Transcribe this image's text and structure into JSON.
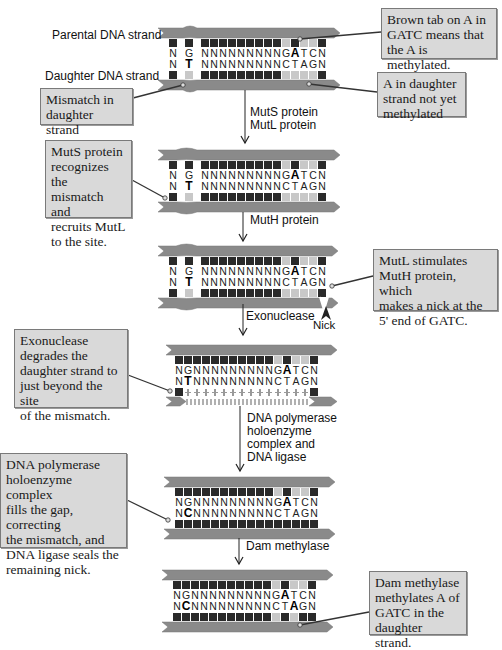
{
  "colors": {
    "backbone": "#8a8a8a",
    "backbone_light": "#a8a8a8",
    "base_dark": "#2a2a2a",
    "base_light": "#c8c8c8",
    "callout_bg": "#d9d9d9",
    "callout_border": "#7a7a7a"
  },
  "labels": {
    "parental": "Parental DNA strand",
    "daughter": "Daughter DNA strand",
    "nick": "Nick"
  },
  "steps": [
    {
      "line1": "MutS protein",
      "line2": "MutL protein"
    },
    {
      "line1": "MutH protein"
    },
    {
      "line1": "Exonuclease"
    },
    {
      "line1": "DNA polymerase",
      "line2": "holoenzyme",
      "line3": "complex and",
      "line4": "DNA ligase"
    },
    {
      "line1": "Dam methylase"
    }
  ],
  "callouts": {
    "brown_tab": [
      "Brown tab on A in",
      "GATC means that",
      "the A is methylated."
    ],
    "not_methylated": [
      "A in daughter",
      "strand not yet",
      "methylated"
    ],
    "mismatch": [
      "Mismatch in",
      "daughter strand"
    ],
    "muts": [
      "MutS protein",
      "recognizes the",
      "mismatch and",
      "recruits MutL",
      "to the site."
    ],
    "mutl": [
      "MutL stimulates",
      "MutH protein, which",
      "makes a nick at the",
      "5' end of GATC."
    ],
    "exo": [
      "Exonuclease",
      "degrades the",
      "daughter strand to",
      "just beyond the site",
      "of the mismatch."
    ],
    "pol": [
      "DNA polymerase",
      "holoenzyme complex",
      "fills the gap, correcting",
      "the mismatch, and",
      "DNA ligase seals the",
      "remaining nick."
    ],
    "dam": [
      "Dam methylase",
      "methylates A of",
      "GATC in the",
      "daughter strand."
    ]
  },
  "sequences": {
    "panel1_top": "N G N N N N N N N N N G A T C N",
    "panel1_bottom": "N T N N N N N N N N N C T A G N",
    "panel5_bottom": "N C N N N N N N N N N C T A G N"
  },
  "panels": [
    {
      "id": "initial",
      "top_seq": "NGNNNNNNNNNGATCN",
      "bottom_seq": "NTNNNNNNNNNCTAGN",
      "mismatch": "G-T"
    },
    {
      "id": "muts-bound",
      "top_seq": "NGNNNNNNNNNGATCN",
      "bottom_seq": "NTNNNNNNNNNCTAGN"
    },
    {
      "id": "nicked",
      "top_seq": "NGNNNNNNNNNGATCN",
      "bottom_seq": "NTNNNNNNNNNCTAGN"
    },
    {
      "id": "degraded",
      "top_seq": "NGNNNNNNNNNGATCN",
      "bottom_seq": "NTNNNNNNNNNCTAGN"
    },
    {
      "id": "repaired",
      "top_seq": "NGNNNNNNNNNGATCN",
      "bottom_seq": "NCNNNNNNNNNCTAGN"
    },
    {
      "id": "methylated",
      "top_seq": "NGNNNNNNNNNGATCN",
      "bottom_seq": "NCNNNNNNNNNCTAGN"
    }
  ]
}
